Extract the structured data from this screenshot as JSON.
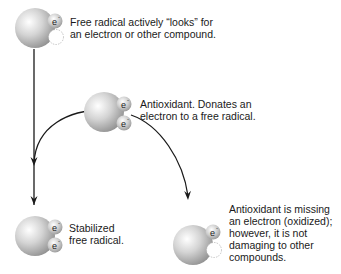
{
  "molecules": [
    {
      "id": "free-radical",
      "label": "Free radical actively “looks” for an electron or other compound.",
      "lines": [
        "Free radical actively “looks” for",
        "an electron or other compound."
      ],
      "electrons": [
        "e",
        ""
      ]
    },
    {
      "id": "antioxidant",
      "label": "Antioxidant. Donates an electron to a free radical.",
      "lines": [
        "Antioxidant. Donates an",
        "electron to a free radical."
      ],
      "electrons": [
        "e",
        "e"
      ]
    },
    {
      "id": "stabilized",
      "label": "Stabilized free radical.",
      "lines": [
        "Stabilized",
        "free radical."
      ],
      "electrons": [
        "e",
        "e"
      ]
    },
    {
      "id": "oxidized-antioxidant",
      "label": "Antioxidant is missing an electron (oxidized); however, it is not damaging to other compounds.",
      "lines": [
        "Antioxidant is missing",
        "an electron (oxidized);",
        "however, it is not",
        "damaging to other",
        "compounds."
      ],
      "electrons": [
        "e",
        ""
      ]
    }
  ],
  "electron_symbol": "e",
  "colors": {
    "sphere_light": "#f2f2f2",
    "sphere_dark": "#8a8a8a",
    "arrow": "#1a1a1a",
    "text": "#1a1a1a"
  }
}
